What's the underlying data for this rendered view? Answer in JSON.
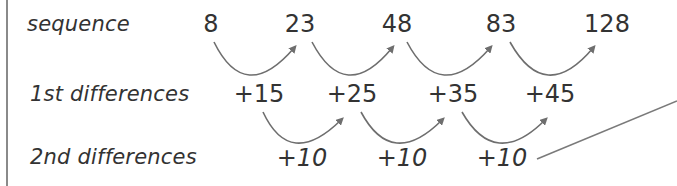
{
  "rows": {
    "sequence": {
      "label": "sequence",
      "values": [
        "8",
        "23",
        "48",
        "83",
        "128"
      ]
    },
    "first_differences": {
      "label": "1st differences",
      "values": [
        "+15",
        "+25",
        "+35",
        "+45"
      ]
    },
    "second_differences": {
      "label": "2nd differences",
      "values": [
        "+10",
        "+10",
        "+10"
      ]
    }
  },
  "colors": {
    "text": "#333333",
    "arrow": "#6e6e6e",
    "border": "#8a8a8a"
  }
}
